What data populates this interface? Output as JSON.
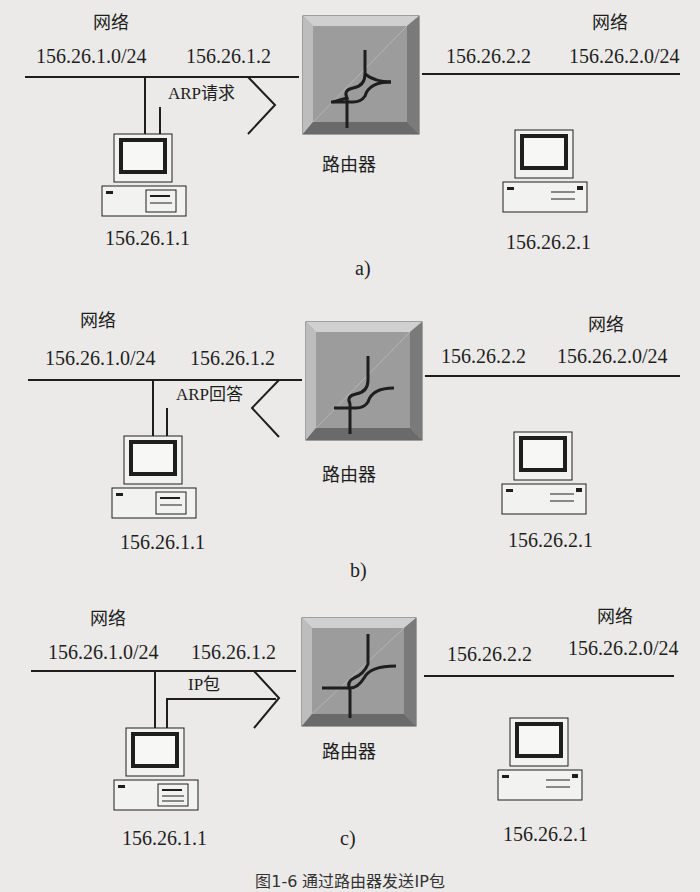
{
  "figure": {
    "router_label": "路由器",
    "caption": "图1-6  通过路由器发送IP包",
    "panels": [
      {
        "id": "a",
        "label": "a)",
        "left_network": {
          "title": "网络",
          "subnet": "156.26.1.0/24",
          "gateway_ip": "156.26.1.2"
        },
        "right_network": {
          "title": "网络",
          "subnet": "156.26.2.0/24",
          "gateway_ip": "156.26.2.2"
        },
        "left_host_ip": "156.26.1.1",
        "right_host_ip": "156.26.2.1",
        "message": "ARP请求",
        "arrow_direction": "toward-router"
      },
      {
        "id": "b",
        "label": "b)",
        "left_network": {
          "title": "网络",
          "subnet": "156.26.1.0/24",
          "gateway_ip": "156.26.1.2"
        },
        "right_network": {
          "title": "网络",
          "subnet": "156.26.2.0/24",
          "gateway_ip": "156.26.2.2"
        },
        "left_host_ip": "156.26.1.1",
        "right_host_ip": "156.26.2.1",
        "message": "ARP回答",
        "arrow_direction": "toward-host"
      },
      {
        "id": "c",
        "label": "c)",
        "left_network": {
          "title": "网络",
          "subnet": "156.26.1.0/24",
          "gateway_ip": "156.26.1.2"
        },
        "right_network": {
          "title": "网络",
          "subnet": "156.26.2.0/24",
          "gateway_ip": "156.26.2.2"
        },
        "left_host_ip": "156.26.1.1",
        "right_host_ip": "156.26.2.1",
        "message": "IP包",
        "arrow_direction": "toward-router"
      }
    ]
  },
  "colors": {
    "background": "#ebeae8",
    "ink": "#1e1e1e",
    "router_face": "#9c9c9c",
    "router_bevel_light": "#c8c8c8",
    "router_bevel_dark": "#6e6e6e"
  }
}
